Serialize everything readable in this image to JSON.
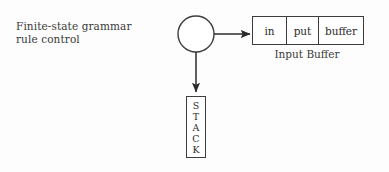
{
  "canvas": {
    "width": 389,
    "height": 172,
    "background": "#fdfdfd",
    "ink": "#2b2b2b"
  },
  "control": {
    "label": "Finite-state grammar\nrule control",
    "shape": "circle",
    "center_x": 196,
    "center_y": 34,
    "radius": 18
  },
  "arrows": [
    {
      "name": "control-to-buffer",
      "direction": "right",
      "x1": 214,
      "y1": 34,
      "x2": 250,
      "y2": 34
    },
    {
      "name": "control-to-stack",
      "direction": "down",
      "x1": 196,
      "y1": 52,
      "x2": 196,
      "y2": 92
    }
  ],
  "input_buffer": {
    "caption": "Input Buffer",
    "cells": [
      "in",
      "put",
      "buffer"
    ]
  },
  "stack": {
    "letters": [
      "S",
      "T",
      "A",
      "C",
      "K"
    ]
  }
}
